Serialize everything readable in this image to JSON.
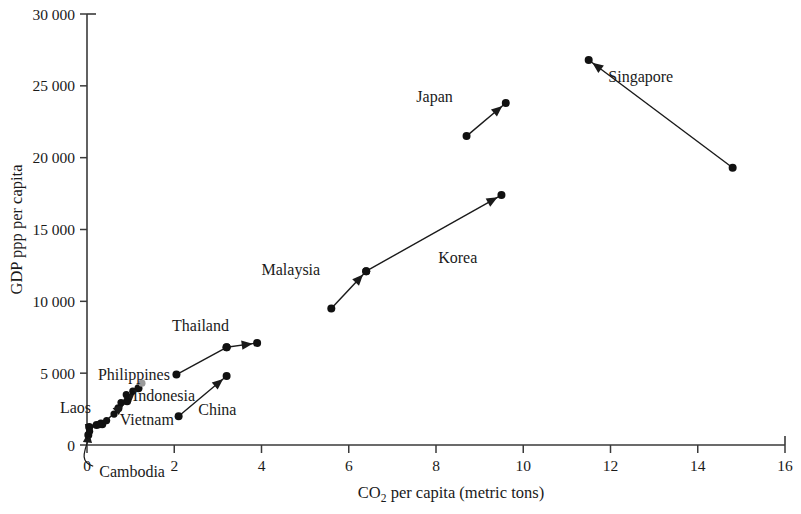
{
  "chart_data": {
    "type": "scatter",
    "title": "",
    "subtitle": "",
    "xlabel_main": "CO",
    "xlabel_sub": "2",
    "xlabel_rest": " per capita (metric tons)",
    "xlabel": "CO2 per capita (metric tons)",
    "ylabel": "GDP ppp per capita",
    "xlim": [
      0,
      16
    ],
    "ylim": [
      0,
      30000
    ],
    "xticks": [
      0,
      2,
      4,
      6,
      8,
      10,
      12,
      14,
      16
    ],
    "xtick_labels": [
      "0",
      "2",
      "4",
      "6",
      "8",
      "10",
      "12",
      "14",
      "16"
    ],
    "yticks": [
      0,
      5000,
      10000,
      15000,
      20000,
      25000,
      30000
    ],
    "ytick_labels": [
      "0",
      "5 000",
      "10 000",
      "15 000",
      "20 000",
      "25 000",
      "30 000"
    ],
    "grid": false,
    "legend": "none",
    "marker_color": "#111111",
    "accent_gray": "#9a9a9a",
    "axis_color": "#3a3a3a",
    "annotation_note": "Each country is shown as an arrow from its earlier year value to its later year value.",
    "series": [
      {
        "name": "Singapore",
        "label": "Singapore",
        "label_x": 11.95,
        "label_y": 25600,
        "start": [
          14.8,
          19300
        ],
        "end": [
          11.5,
          26800
        ],
        "arrow": true
      },
      {
        "name": "Japan",
        "label": "Japan",
        "label_x": 7.55,
        "label_y": 24200,
        "start": [
          8.7,
          21500
        ],
        "end": [
          9.6,
          23800
        ],
        "arrow": true
      },
      {
        "name": "Korea",
        "label": "Korea",
        "label_x": 8.05,
        "label_y": 13000,
        "start": [
          6.4,
          12100
        ],
        "end": [
          9.5,
          17400
        ],
        "arrow": true
      },
      {
        "name": "Malaysia",
        "label": "Malaysia",
        "label_x": 4.0,
        "label_y": 12200,
        "start": [
          5.6,
          9500
        ],
        "end": [
          6.4,
          12100
        ],
        "arrow": true
      },
      {
        "name": "Thailand",
        "label": "Thailand",
        "label_x": 1.95,
        "label_y": 8300,
        "start": [
          3.2,
          6800
        ],
        "end": [
          3.9,
          7100
        ],
        "arrow": true
      },
      {
        "name": "Philippines",
        "label": "Philippines",
        "label_x": 0.25,
        "label_y": 4900,
        "start": [
          2.05,
          4900
        ],
        "end": [
          3.2,
          6800
        ],
        "arrow": false
      },
      {
        "name": "China",
        "label": "China",
        "label_x": 2.55,
        "label_y": 2450,
        "start": [
          2.1,
          2000
        ],
        "end": [
          3.2,
          4800
        ],
        "arrow": true
      },
      {
        "name": "Indonesia",
        "label": "Indonesia",
        "label_x": 1.05,
        "label_y": 3400,
        "start": [
          0.72,
          2550
        ],
        "end": [
          1.18,
          3950
        ],
        "arrow": true
      },
      {
        "name": "Vietnam",
        "label": "Vietnam",
        "label_x": 0.75,
        "label_y": 1750,
        "start": [
          0.35,
          1450
        ],
        "end": [
          0.92,
          3050
        ],
        "arrow": true
      },
      {
        "name": "Laos",
        "label": "Laos",
        "label_x": -0.62,
        "label_y": 2600,
        "start": [
          0.22,
          1400
        ],
        "end": [
          0.32,
          1500
        ],
        "arrow": true
      },
      {
        "name": "Cambodia",
        "label": "Cambodia",
        "label_x": 0.28,
        "label_y": -1900,
        "start": [
          0.03,
          700
        ],
        "end": [
          0.05,
          1250
        ],
        "arrow": true
      }
    ],
    "extra_points": [
      {
        "name": "indonesia-upper-gray",
        "x": 1.26,
        "y": 4300,
        "color": "#9a9a9a"
      },
      {
        "name": "cluster-point-a",
        "x": 0.9,
        "y": 3500,
        "color": "#111111"
      },
      {
        "name": "cluster-point-b",
        "x": 1.05,
        "y": 3750,
        "color": "#111111"
      },
      {
        "name": "cluster-point-c",
        "x": 0.78,
        "y": 2950,
        "color": "#111111"
      },
      {
        "name": "cluster-point-d",
        "x": 0.62,
        "y": 2150,
        "color": "#111111"
      },
      {
        "name": "cluster-point-e",
        "x": 0.45,
        "y": 1700,
        "color": "#111111"
      },
      {
        "name": "cluster-point-f",
        "x": 0.28,
        "y": 1420,
        "color": "#111111"
      },
      {
        "name": "cluster-point-g",
        "x": 0.06,
        "y": 950,
        "color": "#111111"
      }
    ]
  }
}
